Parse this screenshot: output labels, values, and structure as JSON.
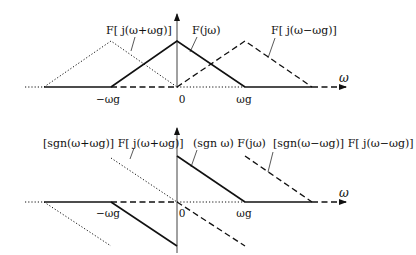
{
  "figure": {
    "top_panel": {
      "axis": {
        "x_label": "ω",
        "ticks": [
          "−ωg",
          "0",
          "ωg"
        ]
      },
      "labels": {
        "left": "F[ j(ω+ωg)]",
        "center": "F(jω)",
        "right": "F[ j(ω−ωg)]"
      },
      "curves": [
        {
          "name": "F[j(ω+ωg)]",
          "style": "dotted",
          "shape": "triangle",
          "center": "−ωg",
          "support": [
            "−2ωg",
            "0"
          ]
        },
        {
          "name": "F(jω)",
          "style": "solid",
          "shape": "triangle",
          "center": "0",
          "support": [
            "−ωg",
            "ωg"
          ]
        },
        {
          "name": "F[j(ω−ωg)]",
          "style": "dashed",
          "shape": "triangle",
          "center": "ωg",
          "support": [
            "0",
            "2ωg"
          ]
        }
      ]
    },
    "bottom_panel": {
      "axis": {
        "x_label": "ω",
        "ticks": [
          "−ωg",
          "0",
          "ωg"
        ]
      },
      "labels": {
        "left": "[sgn(ω+ωg)] F[ j(ω+ωg)]",
        "center": "(sgn ω) F(jω)",
        "right": "[sgn(ω−ωg)] F[ j(ω−ωg)]"
      },
      "curves": [
        {
          "name": "[sgn(ω+ωg)]F[j(ω+ωg)]",
          "style": "dotted",
          "shape": "sgn-weighted triangle",
          "center": "−ωg"
        },
        {
          "name": "(sgn ω)F(jω)",
          "style": "solid",
          "shape": "sgn-weighted triangle",
          "center": "0"
        },
        {
          "name": "[sgn(ω−ωg)]F[j(ω−ωg)]",
          "style": "dashed",
          "shape": "sgn-weighted triangle",
          "center": "ωg"
        }
      ]
    }
  }
}
